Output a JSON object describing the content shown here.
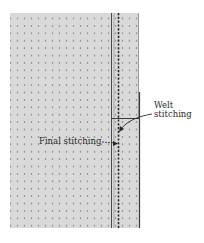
{
  "diagram": {
    "type": "sewing-instruction-illustration",
    "colors": {
      "fabric": "#d9d9d9",
      "dots": "#6e6e6e",
      "lines": "#3a3a3a",
      "background": "#ffffff"
    },
    "labels": {
      "welt_line1": "Welt",
      "welt_line2": "stitching",
      "final": "Final stitching"
    },
    "annotations": [
      {
        "text": "Welt stitching",
        "points_to": "dashed stitch line below welt edge"
      },
      {
        "text": "Final stitching",
        "points_to": "dashed stitch line"
      }
    ]
  }
}
